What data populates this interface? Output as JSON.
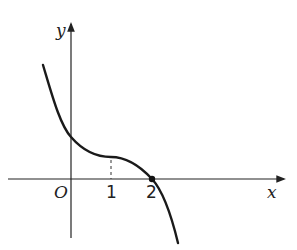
{
  "diagram": {
    "type": "function-graph",
    "axes": {
      "x_label": "x",
      "y_label": "y",
      "origin_label": "O"
    },
    "ticks": {
      "x": [
        {
          "value": 1,
          "label": "1"
        },
        {
          "value": 2,
          "label": "2"
        }
      ]
    },
    "curve": {
      "description": "Decreasing cubic-like curve with horizontal tangent (inflection) at x=1, crossing x-axis at x=2",
      "stationary_point_x": 1,
      "root_x": 2,
      "marked_point": {
        "x": 2,
        "y": 0
      }
    },
    "dashed_guide": {
      "x": 1
    },
    "colors": {
      "stroke": "#1a1a1a",
      "background": "#ffffff"
    }
  }
}
